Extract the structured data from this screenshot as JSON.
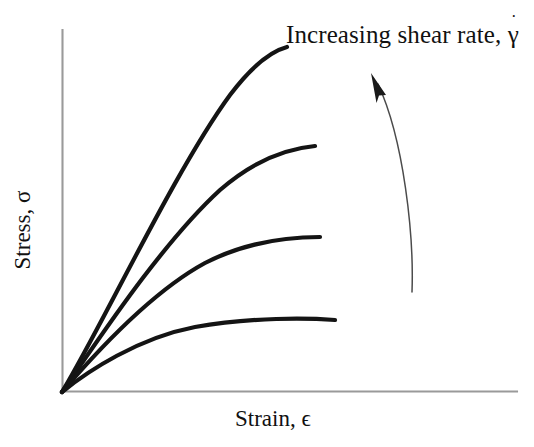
{
  "figure": {
    "name": "stress-strain-shear-rate-schematic",
    "background_color": "#ffffff",
    "axis_color": "#9a9a9a",
    "curve_color": "#141414",
    "arrow_color": "#4b4b4b",
    "text_color": "#111111"
  },
  "labels": {
    "x_axis": "Strain, ϵ",
    "y_axis": "Stress, σ",
    "annotation_prefix": "Increasing shear rate, ",
    "annotation_symbol": "γ",
    "annotation_overdot": "˙",
    "annotation_full": "Increasing shear rate, γ̇"
  },
  "chart_data": {
    "type": "line",
    "title": "",
    "subtitle": "",
    "xlabel": "Strain, ϵ",
    "ylabel": "Stress, σ",
    "xlim": [
      0,
      1
    ],
    "ylim": [
      0,
      1
    ],
    "grid": false,
    "ticks": false,
    "legend": "none",
    "annotations": [
      {
        "text": "Increasing shear rate, γ̇",
        "x": 0.49,
        "y": 0.95,
        "arrow": {
          "type": "curved",
          "from_x": 0.77,
          "from_y": 0.28,
          "to_x": 0.68,
          "to_y": 0.87,
          "direction": "upward-left"
        }
      }
    ],
    "series": [
      {
        "name": "shear-rate-4-highest",
        "order": 4,
        "description": "Highest shear rate, steepest initial slope, highest plateau stress",
        "x": [
          0.0,
          0.05,
          0.11,
          0.18,
          0.26,
          0.34,
          0.41,
          0.47,
          0.5
        ],
        "y": [
          0.0,
          0.22,
          0.41,
          0.58,
          0.72,
          0.83,
          0.9,
          0.94,
          0.95
        ]
      },
      {
        "name": "shear-rate-3",
        "order": 3,
        "description": "Second highest shear rate",
        "x": [
          0.0,
          0.06,
          0.13,
          0.21,
          0.3,
          0.39,
          0.48,
          0.55
        ],
        "y": [
          0.0,
          0.15,
          0.29,
          0.42,
          0.53,
          0.62,
          0.68,
          0.71
        ]
      },
      {
        "name": "shear-rate-2",
        "order": 2,
        "description": "Third highest shear rate",
        "x": [
          0.0,
          0.07,
          0.15,
          0.24,
          0.34,
          0.44,
          0.52,
          0.57
        ],
        "y": [
          0.0,
          0.1,
          0.19,
          0.28,
          0.35,
          0.41,
          0.44,
          0.46
        ]
      },
      {
        "name": "shear-rate-1-lowest",
        "order": 1,
        "description": "Lowest shear rate, shallowest slope, lowest plateau stress",
        "x": [
          0.0,
          0.08,
          0.17,
          0.27,
          0.38,
          0.48,
          0.57,
          0.6
        ],
        "y": [
          0.0,
          0.06,
          0.11,
          0.16,
          0.19,
          0.21,
          0.22,
          0.22
        ]
      }
    ]
  },
  "geometry": {
    "origin": {
      "x": 62,
      "y": 392
    },
    "y_axis_top": {
      "x": 62,
      "y": 30
    },
    "x_axis_right": {
      "x": 517,
      "y": 392
    },
    "curves": [
      {
        "name": "shear-rate-4-highest",
        "d": "M 62 392 C 100 330 175 170 230 95 C 252 66 272 51 287 47"
      },
      {
        "name": "shear-rate-3",
        "d": "M 62 392 C 95 345 160 245 220 190 C 258 157 293 148 315 146"
      },
      {
        "name": "shear-rate-2",
        "d": "M 62 392 C 92 357 148 294 205 263 C 250 240 296 237 320 237"
      },
      {
        "name": "shear-rate-1-lowest",
        "d": "M 62 392 C 88 371 138 338 195 327 C 252 317 308 318 335 320"
      }
    ],
    "arrow": {
      "path": "M 412 292 C 414 236 404 140 378 84",
      "head_points": "372,74 385,93 379,94 376,100"
    }
  }
}
